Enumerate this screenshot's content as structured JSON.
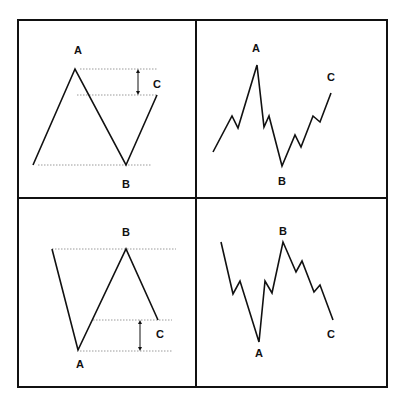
{
  "panels": [
    {
      "id": "top-left",
      "description": "Zigzag correction, simplified",
      "polyline": [
        [
          33,
          165
        ],
        [
          75,
          69
        ],
        [
          126,
          165
        ],
        [
          157,
          95
        ]
      ],
      "dotted_lines": [
        [
          80,
          69,
          157,
          69
        ],
        [
          77,
          95,
          157,
          95
        ],
        [
          38,
          165,
          151,
          165
        ]
      ],
      "arrow": {
        "x": 138,
        "y1": 69,
        "y2": 95
      },
      "labels": [
        {
          "text": "A",
          "x": 78,
          "y": 54
        },
        {
          "text": "B",
          "x": 126,
          "y": 188
        },
        {
          "text": "C",
          "x": 157,
          "y": 88
        }
      ]
    },
    {
      "id": "top-right",
      "description": "Zigzag correction, detailed",
      "polyline": [
        [
          213,
          152
        ],
        [
          232,
          116
        ],
        [
          238,
          128
        ],
        [
          257,
          65
        ],
        [
          264,
          127
        ],
        [
          269,
          116
        ],
        [
          282,
          166
        ],
        [
          295,
          135
        ],
        [
          301,
          147
        ],
        [
          313,
          116
        ],
        [
          320,
          122
        ],
        [
          331,
          93
        ]
      ],
      "labels": [
        {
          "text": "A",
          "x": 256,
          "y": 52
        },
        {
          "text": "B",
          "x": 282,
          "y": 185
        },
        {
          "text": "C",
          "x": 331,
          "y": 81
        }
      ]
    },
    {
      "id": "bottom-left",
      "description": "Inverse zigzag, simplified",
      "polyline": [
        [
          52,
          249
        ],
        [
          78,
          350
        ],
        [
          126,
          249
        ],
        [
          158,
          320
        ]
      ],
      "dotted_lines": [
        [
          52,
          249,
          176,
          249
        ],
        [
          93,
          320,
          172,
          320
        ],
        [
          80,
          351,
          172,
          351
        ]
      ],
      "arrow": {
        "x": 140,
        "y1": 320,
        "y2": 351
      },
      "labels": [
        {
          "text": "B",
          "x": 126,
          "y": 236
        },
        {
          "text": "A",
          "x": 80,
          "y": 368
        },
        {
          "text": "C",
          "x": 160,
          "y": 338
        }
      ]
    },
    {
      "id": "bottom-right",
      "description": "Inverse zigzag, detailed",
      "polyline": [
        [
          221,
          242
        ],
        [
          233,
          294
        ],
        [
          240,
          281
        ],
        [
          259,
          342
        ],
        [
          265,
          281
        ],
        [
          272,
          293
        ],
        [
          283,
          242
        ],
        [
          296,
          272
        ],
        [
          302,
          261
        ],
        [
          314,
          292
        ],
        [
          320,
          285
        ],
        [
          333,
          320
        ]
      ],
      "labels": [
        {
          "text": "B",
          "x": 283,
          "y": 235
        },
        {
          "text": "A",
          "x": 259,
          "y": 357
        },
        {
          "text": "C",
          "x": 331,
          "y": 338
        }
      ]
    }
  ],
  "frame": {
    "x": 18,
    "y": 20,
    "width": 369,
    "height": 367,
    "divider_x": 196,
    "divider_y": 198
  },
  "colors": {
    "line": "#111111",
    "dotted": "#9a9a9a",
    "background": "#ffffff"
  }
}
